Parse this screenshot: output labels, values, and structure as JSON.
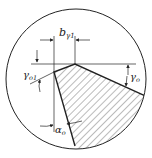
{
  "diagram": {
    "labels": {
      "b_gamma1": {
        "main": "b",
        "sub": "γ1"
      },
      "gamma_o1": {
        "main": "γ",
        "sub": "o1"
      },
      "gamma_o": {
        "main": "γ",
        "sub": "o"
      },
      "alpha_o": {
        "main": "α",
        "sub": "o"
      }
    },
    "colors": {
      "line": "#222222",
      "hatch": "#555555",
      "background": "#ffffff"
    }
  }
}
